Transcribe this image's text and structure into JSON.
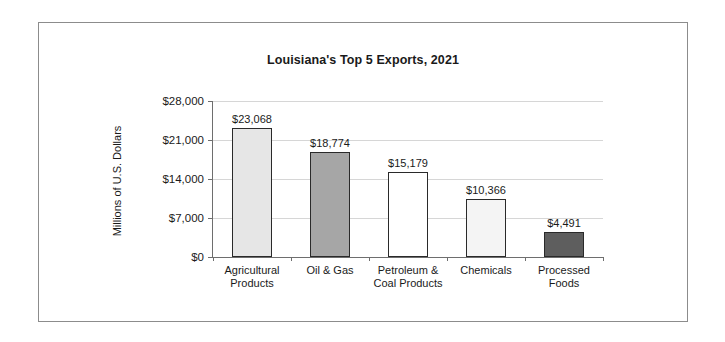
{
  "figure": {
    "border_color": "#8c8c8c",
    "background": "#ffffff"
  },
  "chart_data": {
    "type": "bar",
    "title": "Louisiana's Top 5 Exports, 2021",
    "xlabel": "",
    "ylabel": "Millions of U.S. Dollars",
    "categories": [
      "Agricultural\nProducts",
      "Oil & Gas",
      "Petroleum &\nCoal Products",
      "Chemicals",
      "Processed\nFoods"
    ],
    "values": [
      23068,
      18774,
      15179,
      10366,
      4491
    ],
    "value_labels": [
      "$23,068",
      "$18,774",
      "$15,179",
      "$10,366",
      "$4,491"
    ],
    "bar_colors": [
      "#e6e6e6",
      "#a6a6a6",
      "#ffffff",
      "#f4f4f4",
      "#5e5e5e"
    ],
    "bar_edge_color": "#2a2a2a",
    "ylim": [
      0,
      28000
    ],
    "yticks": [
      0,
      7000,
      14000,
      21000,
      28000
    ],
    "ytick_labels": [
      "$0",
      "$7,000",
      "$14,000",
      "$21,000",
      "$28,000"
    ],
    "grid": true,
    "gridline_color": "#d6d6d6",
    "axis_color": "#6e6e6e",
    "legend": null,
    "legend_position": "none"
  }
}
